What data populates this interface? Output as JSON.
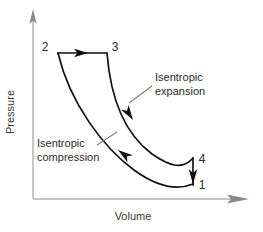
{
  "figure": {
    "background_color": "#ffffff",
    "curve_color": "#111111",
    "axis_color": "#b0b0b0",
    "leader_color": "#7d7d7d",
    "text_color": "#2b2b2b"
  },
  "axes": {
    "x_label": "Volume",
    "y_label": "Pressure",
    "origin": {
      "x": 33,
      "y": 199
    },
    "x_end": {
      "x": 248,
      "y": 199
    },
    "y_end": {
      "x": 33,
      "y": 10
    }
  },
  "state_points": [
    {
      "id": "1",
      "label": "1",
      "x": 193,
      "y": 184,
      "label_x": 199,
      "label_y": 189
    },
    {
      "id": "2",
      "label": "2",
      "x": 58,
      "y": 53,
      "label_x": 45,
      "label_y": 51
    },
    {
      "id": "3",
      "label": "3",
      "x": 107,
      "y": 53,
      "label_x": 112,
      "label_y": 51
    },
    {
      "id": "4",
      "label": "4",
      "x": 193,
      "y": 158,
      "label_x": 199,
      "label_y": 163
    }
  ],
  "processes": [
    {
      "id": "heat-addition",
      "from": "2",
      "to": "3",
      "kind": "straight",
      "path": "M 58 53 L 107 53",
      "arrow": {
        "x": 85,
        "y": 53,
        "rotation": 0
      }
    },
    {
      "id": "isentropic-expansion",
      "from": "3",
      "to": "4",
      "kind": "curve",
      "path": "M 107 53 C 110 92 121 131 152 154 C 168 165 182 171 193 158",
      "arrow": {
        "x": 131,
        "y": 117,
        "rotation": 52
      }
    },
    {
      "id": "heat-rejection",
      "from": "4",
      "to": "1",
      "kind": "straight",
      "path": "M 193 158 L 193 184",
      "arrow": {
        "x": 193,
        "y": 176,
        "rotation": 90
      }
    },
    {
      "id": "isentropic-compression",
      "from": "1",
      "to": "2",
      "kind": "curve",
      "path": "M 193 184 C 176 191 156 186 134 170 C 104 148 70 104 58 53",
      "arrow": {
        "x": 121,
        "y": 154,
        "rotation": 217
      }
    }
  ],
  "annotations": [
    {
      "id": "isentropic-expansion-annotation",
      "line1": "Isentropic",
      "line2": "expansion",
      "x": 155,
      "y1": 81,
      "y2": 94,
      "leader_path": "M 151 86 L 130 102"
    },
    {
      "id": "isentropic-compression-annotation",
      "line1": "Isentropic",
      "line2": "compression",
      "x": 37,
      "y1": 147,
      "y2": 161,
      "leader_path": "M 97 145 L 116 133"
    }
  ]
}
